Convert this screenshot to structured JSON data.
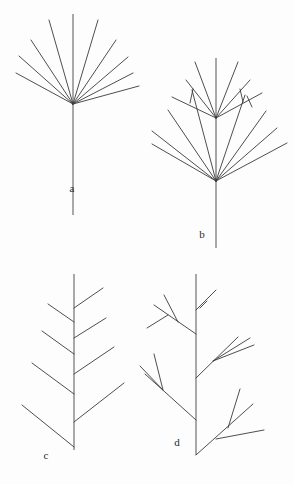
{
  "figure": {
    "background_color": "#fdfdfd",
    "line_color": "#3a3a3a",
    "axis_color": "#555555",
    "label_color": "#2b2b2b",
    "width": 294,
    "height": 484,
    "panel_count": 4
  },
  "panels": [
    {
      "id": "a",
      "label": "a",
      "label_x": 72,
      "label_y": 192,
      "description": "simple umbel-like fan of unbranched rays from one node",
      "node": {
        "x": 73,
        "y": 104
      },
      "axis": {
        "x1": 73,
        "y1": 104,
        "x2": 73,
        "y2": 215
      },
      "upper_axis": {
        "x1": 73,
        "y1": 104,
        "x2": 73,
        "y2": 14
      },
      "rays": [
        {
          "x2": 16,
          "y2": 73
        },
        {
          "x2": 19,
          "y2": 56
        },
        {
          "x2": 31,
          "y2": 40
        },
        {
          "x2": 49,
          "y2": 20
        },
        {
          "x2": 98,
          "y2": 20
        },
        {
          "x2": 116,
          "y2": 40
        },
        {
          "x2": 128,
          "y2": 57
        },
        {
          "x2": 133,
          "y2": 73
        },
        {
          "x2": 139,
          "y2": 86
        }
      ]
    },
    {
      "id": "b",
      "label": "b",
      "label_x": 202,
      "label_y": 238,
      "description": "compound umbel: main fan with a secondary fan and small sub-branches",
      "node": {
        "x": 216,
        "y": 181
      },
      "axis": {
        "x1": 216,
        "y1": 181,
        "x2": 216,
        "y2": 248
      },
      "rays": [
        {
          "x2": 152,
          "y2": 144
        },
        {
          "x2": 152,
          "y2": 131
        },
        {
          "x2": 168,
          "y2": 110
        },
        {
          "x2": 192,
          "y2": 90
        },
        {
          "x2": 216,
          "y2": 118
        },
        {
          "x2": 245,
          "y2": 95
        },
        {
          "x2": 266,
          "y2": 111
        },
        {
          "x2": 277,
          "y2": 128
        },
        {
          "x2": 287,
          "y2": 143
        }
      ],
      "secondary_node": {
        "x": 216,
        "y": 118
      },
      "secondary_axis": {
        "x1": 216,
        "y1": 118,
        "x2": 216,
        "y2": 58
      },
      "secondary_rays": [
        {
          "x2": 172,
          "y2": 97
        },
        {
          "x2": 186,
          "y2": 80
        },
        {
          "x2": 195,
          "y2": 62
        },
        {
          "x2": 238,
          "y2": 62
        },
        {
          "x2": 250,
          "y2": 80
        },
        {
          "x2": 262,
          "y2": 93
        }
      ],
      "sub_branches": [
        {
          "x1": 193,
          "y1": 89,
          "x2": 190,
          "y2": 103
        },
        {
          "x1": 240,
          "y1": 89,
          "x2": 243,
          "y2": 102
        },
        {
          "x1": 247,
          "y1": 96,
          "x2": 252,
          "y2": 107
        }
      ]
    },
    {
      "id": "c",
      "label": "c",
      "label_x": 46,
      "label_y": 459,
      "description": "monopodial stem with simple alternate lateral branches, increasing in length downward",
      "stem": {
        "x1": 74,
        "y1": 274,
        "x2": 74,
        "y2": 450
      },
      "branches": [
        {
          "x1": 74,
          "y1": 308,
          "x2": 103,
          "y2": 288,
          "side": "right"
        },
        {
          "x1": 74,
          "y1": 322,
          "x2": 48,
          "y2": 304,
          "side": "left"
        },
        {
          "x1": 74,
          "y1": 338,
          "x2": 106,
          "y2": 318,
          "side": "right"
        },
        {
          "x1": 74,
          "y1": 354,
          "x2": 42,
          "y2": 331,
          "side": "left"
        },
        {
          "x1": 74,
          "y1": 374,
          "x2": 114,
          "y2": 347,
          "side": "right"
        },
        {
          "x1": 74,
          "y1": 394,
          "x2": 32,
          "y2": 363,
          "side": "left"
        },
        {
          "x1": 74,
          "y1": 422,
          "x2": 124,
          "y2": 383,
          "side": "right"
        },
        {
          "x1": 74,
          "y1": 447,
          "x2": 22,
          "y2": 405,
          "side": "left"
        }
      ]
    },
    {
      "id": "d",
      "label": "d",
      "label_x": 177,
      "label_y": 446,
      "description": "monopodial stem with compound alternate branches, each bearing sub-branches",
      "stem": {
        "x1": 196,
        "y1": 274,
        "x2": 196,
        "y2": 455
      },
      "branches": [
        {
          "x1": 196,
          "y1": 310,
          "x2": 216,
          "y2": 290,
          "side": "right",
          "sub": [
            {
              "x1": 207,
              "y1": 301,
              "x2": 200,
              "y2": 308
            }
          ]
        },
        {
          "x1": 196,
          "y1": 334,
          "x2": 154,
          "y2": 305,
          "side": "left",
          "sub": [
            {
              "x1": 178,
              "y1": 322,
              "x2": 164,
              "y2": 295
            },
            {
              "x1": 168,
              "y1": 315,
              "x2": 147,
              "y2": 328
            }
          ]
        },
        {
          "x1": 196,
          "y1": 378,
          "x2": 238,
          "y2": 337,
          "side": "right",
          "sub": [
            {
              "x1": 213,
              "y1": 361,
              "x2": 250,
              "y2": 338
            },
            {
              "x1": 213,
              "y1": 361,
              "x2": 254,
              "y2": 345
            }
          ]
        },
        {
          "x1": 196,
          "y1": 420,
          "x2": 145,
          "y2": 374,
          "side": "left",
          "sub": [
            {
              "x1": 163,
              "y1": 390,
              "x2": 154,
              "y2": 354
            },
            {
              "x1": 163,
              "y1": 390,
              "x2": 140,
              "y2": 366
            }
          ]
        },
        {
          "x1": 196,
          "y1": 455,
          "x2": 253,
          "y2": 404,
          "side": "right",
          "sub": [
            {
              "x1": 228,
              "y1": 428,
              "x2": 240,
              "y2": 389
            },
            {
              "x1": 216,
              "y1": 439,
              "x2": 264,
              "y2": 430
            }
          ]
        }
      ]
    }
  ]
}
